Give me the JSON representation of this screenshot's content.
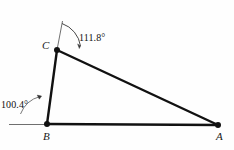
{
  "figure": {
    "kind": "geometry-diagram",
    "background_color": "#fefefe",
    "stroke_color": "#111111",
    "thin_stroke_color": "#555555"
  },
  "vertices": [
    {
      "id": "C",
      "label": "C",
      "x": 57,
      "y": 50
    },
    {
      "id": "B",
      "label": "B",
      "x": 47,
      "y": 124
    },
    {
      "id": "A",
      "label": "A",
      "x": 218,
      "y": 125
    }
  ],
  "edges": [
    {
      "id": "BC",
      "from": "B",
      "to": "C"
    },
    {
      "id": "CA",
      "from": "C",
      "to": "A"
    },
    {
      "id": "BA",
      "from": "B",
      "to": "A"
    }
  ],
  "angles": [
    {
      "id": "angle-at-C",
      "vertex": "C",
      "value": "111.8",
      "label": "111.8°",
      "label_x": 79,
      "label_y": 33
    },
    {
      "id": "angle-at-B",
      "vertex": "B",
      "value": "100.4",
      "label": "100.4°",
      "label_x": 1,
      "label_y": 100
    }
  ],
  "guides": [
    {
      "id": "extension-above-C",
      "type": "ray",
      "note": "thin line extending up from C"
    },
    {
      "id": "horizontal-left-of-B",
      "type": "ray",
      "note": "thin horizontal line extending left from B"
    }
  ]
}
